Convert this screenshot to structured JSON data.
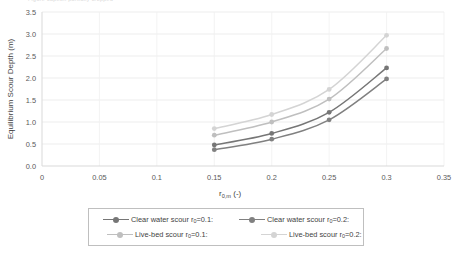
{
  "figure": {
    "clipped_top_text": "Figure caption partially cropped"
  },
  "chart_data": {
    "type": "line",
    "title": "",
    "xlabel": "r0,m (-)",
    "xlabel_base": "r",
    "xlabel_sub": "0,m",
    "xlabel_unit": "(-)",
    "ylabel": "Equilibrium Scour Depth (m)",
    "xlim": [
      0,
      0.35
    ],
    "ylim": [
      0,
      3.5
    ],
    "xticks": [
      "0",
      "0.05",
      "0.1",
      "0.15",
      "0.2",
      "0.25",
      "0.3",
      "0.35"
    ],
    "xtick_values": [
      0,
      0.05,
      0.1,
      0.15,
      0.2,
      0.25,
      0.3,
      0.35
    ],
    "yticks": [
      "0.0",
      "0.5",
      "1.0",
      "1.5",
      "2.0",
      "2.5",
      "3.0",
      "3.5"
    ],
    "ytick_values": [
      0,
      0.5,
      1.0,
      1.5,
      2.0,
      2.5,
      3.0,
      3.5
    ],
    "grid": true,
    "legend_position": "bottom",
    "x": [
      0.15,
      0.2,
      0.25,
      0.3
    ],
    "series": [
      {
        "name": "Clear water scour r0=0.1:",
        "label_base": "Clear water scour r",
        "label_sub": "0",
        "label_tail": "=0.1:",
        "color": "#767676",
        "values": [
          0.48,
          0.74,
          1.22,
          2.23
        ]
      },
      {
        "name": "Clear water scour r0=0.2:",
        "label_base": "Clear water scour r",
        "label_sub": "0",
        "label_tail": "=0.2:",
        "color": "#808080",
        "values": [
          0.37,
          0.61,
          1.05,
          1.98
        ]
      },
      {
        "name": "Live-bed scour r0=0.1:",
        "label_base": "Live-bed scour r",
        "label_sub": "0",
        "label_tail": "=0.1:",
        "color": "#bfbfbf",
        "values": [
          0.7,
          1.0,
          1.52,
          2.67
        ]
      },
      {
        "name": "Live-bed scour r0=0.2:",
        "label_base": "Live-bed scour r",
        "label_sub": "0",
        "label_tail": "=0.2:",
        "color": "#d4d4d4",
        "values": [
          0.85,
          1.17,
          1.74,
          2.97
        ]
      }
    ]
  },
  "legend": {
    "entries": [
      {
        "label": "Clear water scour r0=0.1:"
      },
      {
        "label": "Clear water scour r0=0.2:"
      },
      {
        "label": "Live-bed scour r0=0.1:"
      },
      {
        "label": "Live-bed scour r0=0.2:"
      }
    ]
  }
}
